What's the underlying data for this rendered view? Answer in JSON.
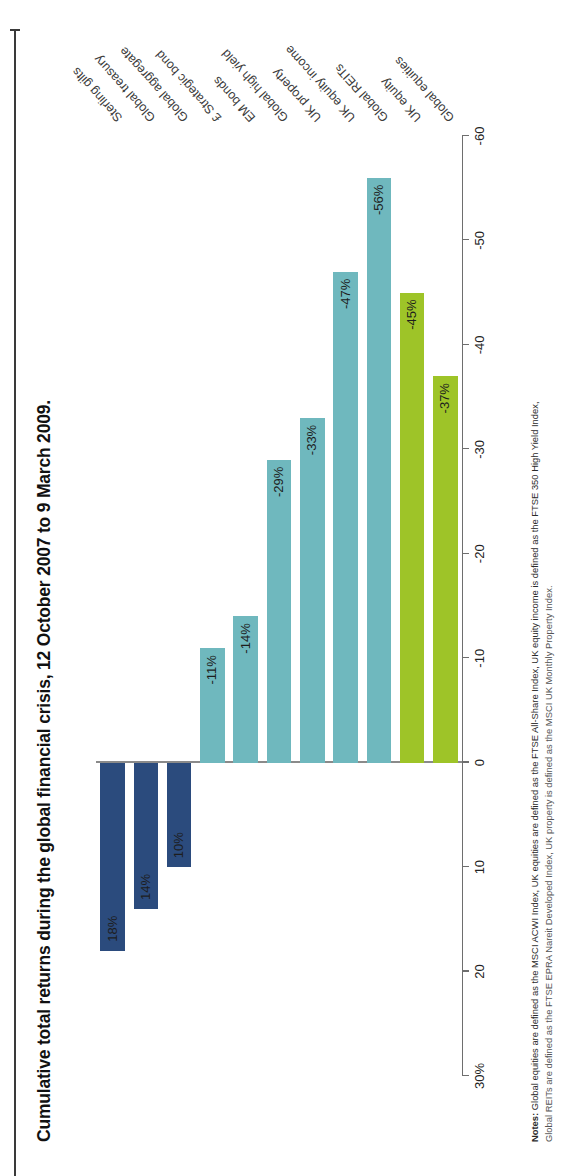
{
  "title": "Cumulative total returns during the global financial crisis, 12 October 2007 to 9 March 2009.",
  "notes": {
    "prefix": "Notes:",
    "line1": " Global equities are defined as the MSCI ACWI Index, UK equities are defined as the FTSE All-Share Index, UK equity income is defined as the FTSE 350 High Yield Index,",
    "line2": "Global REITs are defined as the FTSE EPRA Nareit Developed Index, UK property is defined as the MSCI UK Monthly Property Index."
  },
  "colors": {
    "equity_green": "#9ec428",
    "credit_teal": "#6fb8be",
    "bond_navy": "#2b4b7d",
    "axis": "#6e6e6e",
    "text": "#1d1d1d"
  },
  "chart_data": {
    "type": "bar",
    "orientation": "horizontal",
    "title": "Cumulative total returns during the global financial crisis, 12 October 2007 to 9 March 2009.",
    "xlabel": "",
    "ylabel": "",
    "ylim": [
      -60,
      30
    ],
    "axis_ticks": [
      "30%",
      "20",
      "10",
      "0",
      "-10",
      "-20",
      "-30",
      "-40",
      "-50",
      "-60"
    ],
    "axis_tick_values": [
      30,
      20,
      10,
      0,
      -10,
      -20,
      -30,
      -40,
      -50,
      -60
    ],
    "grid": false,
    "legend": "none",
    "categories": [
      "Global equities",
      "UK equity",
      "Global REITs",
      "UK equity income",
      "UK property",
      "Global high yield",
      "EM bonds",
      "£ Strategic bond",
      "Global aggregate",
      "Global treasury",
      "Sterling gilts"
    ],
    "values": [
      -37,
      -45,
      -56,
      -47,
      -33,
      -29,
      -14,
      -11,
      10,
      14,
      18
    ],
    "labels": [
      "-37%",
      "-45%",
      "-56%",
      "-47%",
      "-33%",
      "-29%",
      "-14%",
      "-11%",
      "10%",
      "14%",
      "18%"
    ],
    "groups": [
      "equity",
      "equity",
      "credit",
      "credit",
      "credit",
      "credit",
      "credit",
      "credit",
      "bond",
      "bond",
      "bond"
    ],
    "bar_colors": [
      "#9ec428",
      "#9ec428",
      "#6fb8be",
      "#6fb8be",
      "#6fb8be",
      "#6fb8be",
      "#6fb8be",
      "#6fb8be",
      "#2b4b7d",
      "#2b4b7d",
      "#2b4b7d"
    ]
  }
}
